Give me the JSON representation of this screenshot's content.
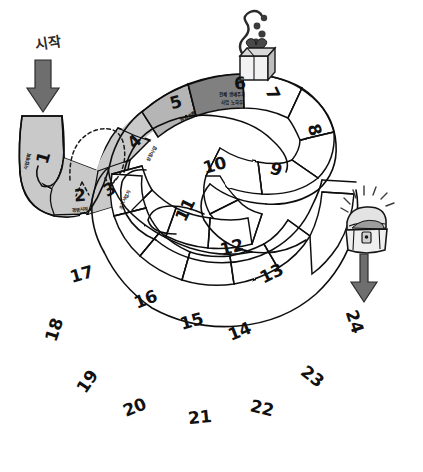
{
  "board": {
    "start_label": "시작",
    "cells": [
      {
        "number": "1",
        "label": "사업계획",
        "shade": "light"
      },
      {
        "number": "2",
        "label": "경영시작",
        "shade": "light"
      },
      {
        "number": "3",
        "label": "초기사업자",
        "shade": "light"
      },
      {
        "number": "4",
        "label": "성장사업",
        "shade": "light"
      },
      {
        "number": "5",
        "label": "현금흐름",
        "shade": "medium"
      },
      {
        "number": "6",
        "label_line1": "전체 생애주기",
        "label_line2": "사업 노하우",
        "shade": "dark"
      },
      {
        "number": "7",
        "label": "",
        "shade": "white"
      },
      {
        "number": "8",
        "label": "",
        "shade": "white"
      },
      {
        "number": "9",
        "label": "",
        "shade": "white"
      },
      {
        "number": "10",
        "label": "",
        "shade": "white"
      },
      {
        "number": "11",
        "label": "",
        "shade": "white"
      },
      {
        "number": "12",
        "label": "",
        "shade": "white"
      },
      {
        "number": "13",
        "label": "",
        "shade": "white"
      },
      {
        "number": "14",
        "label": "",
        "shade": "white"
      },
      {
        "number": "15",
        "label": "",
        "shade": "white"
      },
      {
        "number": "16",
        "label": "",
        "shade": "white"
      },
      {
        "number": "17",
        "label": "",
        "shade": "white"
      },
      {
        "number": "18",
        "label": "",
        "shade": "white"
      },
      {
        "number": "19",
        "label": "",
        "shade": "white"
      },
      {
        "number": "20",
        "label": "",
        "shade": "white"
      },
      {
        "number": "21",
        "label": "",
        "shade": "white"
      },
      {
        "number": "22",
        "label": "",
        "shade": "white"
      },
      {
        "number": "23",
        "label": "",
        "shade": "white"
      },
      {
        "number": "24",
        "label": "",
        "shade": "white"
      }
    ],
    "icons": {
      "start_arrow": "down-arrow-icon",
      "shortcut": "dashed-shortcut-arrow-icon",
      "gift_box": "gift-box-icon",
      "treasure_chest": "treasure-chest-icon",
      "goal_arrow": "up-arrow-icon"
    },
    "colors": {
      "ink": "#111111",
      "light_fill": "#c9c9c9",
      "medium_fill": "#b0b0b0",
      "dark_fill": "#7d7d7d",
      "white_fill": "#ffffff",
      "arrow_fill": "#6e6e6e"
    }
  }
}
